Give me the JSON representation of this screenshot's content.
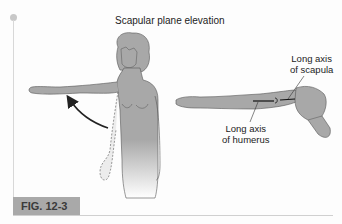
{
  "figure": {
    "title": "Scapular plane elevation",
    "labels": {
      "scapula_axis": [
        "Long axis",
        "of scapula"
      ],
      "humerus_axis": [
        "Long axis",
        "of humerus"
      ]
    },
    "caption_badge": "FIG. 12-3"
  },
  "colors": {
    "body_fill": "#a8a8a8",
    "badge_bg": "#a9a9a9",
    "outline": "#555555"
  }
}
